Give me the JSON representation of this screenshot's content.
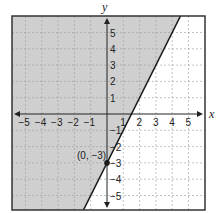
{
  "chart_data": {
    "type": "line",
    "title": "",
    "xlabel": "x",
    "ylabel": "y",
    "xlim": [
      -5.9,
      6
    ],
    "ylim": [
      -5.9,
      6
    ],
    "grid": true,
    "x_ticks": [
      -5,
      -4,
      -3,
      -2,
      -1,
      1,
      2,
      3,
      4,
      5
    ],
    "y_ticks": [
      -5,
      -4,
      -3,
      -2,
      -1,
      1,
      2,
      3,
      4,
      5
    ],
    "x_tick_labels": [
      "−5",
      "−4",
      "−3",
      "−2",
      "−1",
      "1",
      "2",
      "3",
      "4",
      "5"
    ],
    "y_tick_labels": [
      "−5",
      "−4",
      "−3",
      "−2",
      "−1",
      "1",
      "2",
      "3",
      "4",
      "5"
    ],
    "series": [
      {
        "name": "boundary line y = 2x − 3",
        "slope": 2,
        "intercept": -3,
        "style": "solid",
        "points": [
          [
            -1.45,
            -5.9
          ],
          [
            4.45,
            5.9
          ]
        ]
      }
    ],
    "shaded_region": {
      "description": "region left of / above the line",
      "inequality": "y ≥ 2x − 3",
      "color": "#cfcfcf"
    },
    "annotations": [
      {
        "label": "(0, −3)",
        "x": 0,
        "y": -3,
        "marker": "filled-circle"
      }
    ]
  },
  "colors": {
    "shade": "#cfcfcf",
    "line": "#1a1a1a",
    "grid": "#9a9a9a",
    "frame": "#333333",
    "background": "#ffffff"
  },
  "labels": {
    "x_axis": "x",
    "y_axis": "y",
    "point": "(0, −3)"
  }
}
